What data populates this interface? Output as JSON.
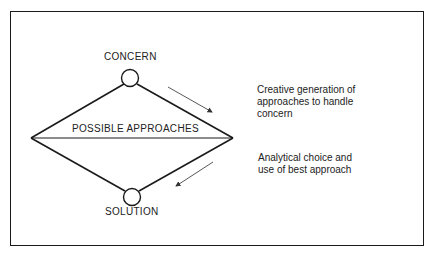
{
  "diagram": {
    "nodes": {
      "top": {
        "label": "CONCERN"
      },
      "bottom": {
        "label": "SOLUTION"
      }
    },
    "middle_label": "POSSIBLE APPROACHES",
    "annotations": {
      "divergent": {
        "lines": [
          "Creative generation of",
          "approaches to handle",
          "concern"
        ]
      },
      "convergent": {
        "lines": [
          "Analytical choice and",
          "use of best approach"
        ]
      }
    },
    "colors": {
      "stroke": "#1a1a1a",
      "arrow": "#444444",
      "background": "#ffffff"
    }
  }
}
